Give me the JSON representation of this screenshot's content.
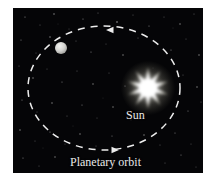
{
  "figure": {
    "background_color": "#ffffff",
    "sky_color": "#050507",
    "line_color": "#e8e8e8"
  },
  "panel": {
    "x": 13,
    "y": 8,
    "width": 190,
    "height": 165
  },
  "labels": {
    "sun": "Sun",
    "orbit": "Planetary orbit"
  },
  "bodies": {
    "sun": {
      "name": "Sun",
      "center_x": 135,
      "center_y": 80,
      "points": 10,
      "outer_radius": 21,
      "inner_radius": 8,
      "color": "#ffffff",
      "glow_color": "#fdfbe8"
    },
    "planet": {
      "name": "planet",
      "center_x": 48,
      "center_y": 40,
      "radius": 6,
      "color": "#d8d8d6"
    }
  },
  "orbit": {
    "name": "Planetary orbit",
    "center_x": 91,
    "center_y": 80,
    "radius_x": 76,
    "radius_y": 62,
    "style": "dashed",
    "dash_pattern": "7 6",
    "stroke_width": 1.5,
    "color": "#ededed",
    "direction": "counterclockwise"
  },
  "arrows": [
    {
      "name": "orbit-arrow-top",
      "x": 99,
      "y": 22,
      "direction": "left"
    },
    {
      "name": "orbit-arrow-bottom",
      "x": 100,
      "y": 142,
      "direction": "right"
    }
  ],
  "stars": [
    {
      "x": 12,
      "y": 9,
      "r": 0.6,
      "o": 0.55
    },
    {
      "x": 27,
      "y": 17,
      "r": 0.5,
      "o": 0.4
    },
    {
      "x": 41,
      "y": 6,
      "r": 0.7,
      "o": 0.6
    },
    {
      "x": 56,
      "y": 21,
      "r": 0.5,
      "o": 0.35
    },
    {
      "x": 70,
      "y": 11,
      "r": 0.6,
      "o": 0.5
    },
    {
      "x": 85,
      "y": 5,
      "r": 0.5,
      "o": 0.45
    },
    {
      "x": 104,
      "y": 14,
      "r": 0.8,
      "o": 0.62
    },
    {
      "x": 120,
      "y": 7,
      "r": 0.5,
      "o": 0.4
    },
    {
      "x": 136,
      "y": 18,
      "r": 0.6,
      "o": 0.5
    },
    {
      "x": 151,
      "y": 9,
      "r": 0.5,
      "o": 0.38
    },
    {
      "x": 167,
      "y": 16,
      "r": 0.7,
      "o": 0.55
    },
    {
      "x": 181,
      "y": 6,
      "r": 0.5,
      "o": 0.42
    },
    {
      "x": 8,
      "y": 32,
      "r": 0.6,
      "o": 0.48
    },
    {
      "x": 23,
      "y": 45,
      "r": 0.5,
      "o": 0.35
    },
    {
      "x": 37,
      "y": 29,
      "r": 0.7,
      "o": 0.58
    },
    {
      "x": 63,
      "y": 33,
      "r": 0.5,
      "o": 0.4
    },
    {
      "x": 78,
      "y": 44,
      "r": 0.6,
      "o": 0.5
    },
    {
      "x": 93,
      "y": 36,
      "r": 0.5,
      "o": 0.36
    },
    {
      "x": 110,
      "y": 47,
      "r": 0.7,
      "o": 0.55
    },
    {
      "x": 125,
      "y": 30,
      "r": 0.5,
      "o": 0.42
    },
    {
      "x": 158,
      "y": 42,
      "r": 0.6,
      "o": 0.5
    },
    {
      "x": 173,
      "y": 31,
      "r": 0.5,
      "o": 0.38
    },
    {
      "x": 186,
      "y": 47,
      "r": 0.7,
      "o": 0.56
    },
    {
      "x": 6,
      "y": 58,
      "r": 0.5,
      "o": 0.4
    },
    {
      "x": 20,
      "y": 70,
      "r": 0.7,
      "o": 0.55
    },
    {
      "x": 34,
      "y": 61,
      "r": 0.5,
      "o": 0.36
    },
    {
      "x": 49,
      "y": 74,
      "r": 0.6,
      "o": 0.48
    },
    {
      "x": 64,
      "y": 63,
      "r": 0.5,
      "o": 0.4
    },
    {
      "x": 80,
      "y": 76,
      "r": 0.7,
      "o": 0.52
    },
    {
      "x": 96,
      "y": 65,
      "r": 0.5,
      "o": 0.38
    },
    {
      "x": 112,
      "y": 78,
      "r": 0.6,
      "o": 0.45
    },
    {
      "x": 170,
      "y": 67,
      "r": 0.5,
      "o": 0.4
    },
    {
      "x": 184,
      "y": 79,
      "r": 0.7,
      "o": 0.55
    },
    {
      "x": 9,
      "y": 92,
      "r": 0.6,
      "o": 0.5
    },
    {
      "x": 24,
      "y": 104,
      "r": 0.5,
      "o": 0.36
    },
    {
      "x": 39,
      "y": 95,
      "r": 0.7,
      "o": 0.54
    },
    {
      "x": 54,
      "y": 108,
      "r": 0.5,
      "o": 0.4
    },
    {
      "x": 69,
      "y": 97,
      "r": 0.6,
      "o": 0.47
    },
    {
      "x": 84,
      "y": 110,
      "r": 0.5,
      "o": 0.35
    },
    {
      "x": 100,
      "y": 99,
      "r": 0.7,
      "o": 0.52
    },
    {
      "x": 175,
      "y": 103,
      "r": 0.6,
      "o": 0.48
    },
    {
      "x": 188,
      "y": 94,
      "r": 0.5,
      "o": 0.4
    },
    {
      "x": 7,
      "y": 122,
      "r": 0.7,
      "o": 0.55
    },
    {
      "x": 22,
      "y": 133,
      "r": 0.5,
      "o": 0.38
    },
    {
      "x": 37,
      "y": 124,
      "r": 0.6,
      "o": 0.5
    },
    {
      "x": 52,
      "y": 136,
      "r": 0.5,
      "o": 0.36
    },
    {
      "x": 67,
      "y": 126,
      "r": 0.7,
      "o": 0.53
    },
    {
      "x": 83,
      "y": 138,
      "r": 0.5,
      "o": 0.4
    },
    {
      "x": 99,
      "y": 128,
      "r": 0.6,
      "o": 0.46
    },
    {
      "x": 115,
      "y": 139,
      "r": 0.5,
      "o": 0.37
    },
    {
      "x": 131,
      "y": 127,
      "r": 0.7,
      "o": 0.54
    },
    {
      "x": 147,
      "y": 137,
      "r": 0.5,
      "o": 0.4
    },
    {
      "x": 162,
      "y": 125,
      "r": 0.6,
      "o": 0.48
    },
    {
      "x": 178,
      "y": 136,
      "r": 0.5,
      "o": 0.36
    },
    {
      "x": 10,
      "y": 150,
      "r": 0.6,
      "o": 0.5
    },
    {
      "x": 26,
      "y": 158,
      "r": 0.5,
      "o": 0.38
    },
    {
      "x": 42,
      "y": 149,
      "r": 0.7,
      "o": 0.52
    },
    {
      "x": 152,
      "y": 155,
      "r": 0.5,
      "o": 0.4
    },
    {
      "x": 168,
      "y": 147,
      "r": 0.6,
      "o": 0.48
    },
    {
      "x": 183,
      "y": 159,
      "r": 0.5,
      "o": 0.35
    },
    {
      "x": 15,
      "y": 84,
      "r": 0.5,
      "o": 0.3
    },
    {
      "x": 45,
      "y": 16,
      "r": 0.4,
      "o": 0.3
    },
    {
      "x": 90,
      "y": 90,
      "r": 0.4,
      "o": 0.28
    },
    {
      "x": 140,
      "y": 60,
      "r": 0.4,
      "o": 0.3
    },
    {
      "x": 60,
      "y": 118,
      "r": 0.4,
      "o": 0.3
    },
    {
      "x": 118,
      "y": 112,
      "r": 0.4,
      "o": 0.28
    },
    {
      "x": 30,
      "y": 140,
      "r": 0.4,
      "o": 0.3
    },
    {
      "x": 160,
      "y": 20,
      "r": 0.4,
      "o": 0.32
    }
  ]
}
